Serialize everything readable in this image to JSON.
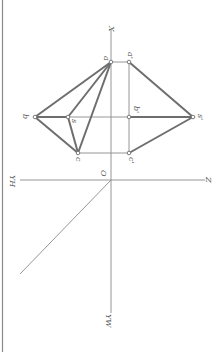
{
  "diagram": {
    "colors": {
      "background": "#ffffff",
      "frame": "#8a8a8a",
      "axis": "#8a8a8a",
      "projection_edge": "#6e6e6e",
      "label": "#555555"
    },
    "labels": {
      "x_axis": "X",
      "z_axis": "Z",
      "yh_axis": "YH",
      "yw_axis": "YW",
      "origin": "O",
      "a": "a",
      "b": "b",
      "c": "c",
      "s": "s",
      "a_prime": "a'",
      "b_prime": "b'",
      "c_prime": "c'",
      "s_prime": "s'"
    },
    "points": {
      "O": [
        111,
        180
      ],
      "a": [
        111,
        62
      ],
      "b": [
        35,
        117
      ],
      "s": [
        68,
        117
      ],
      "c": [
        78,
        153
      ],
      "a_prime": [
        129,
        62
      ],
      "b_prime": [
        129,
        117
      ],
      "c_prime": [
        129,
        153
      ],
      "s_prime": [
        193,
        117
      ]
    }
  }
}
